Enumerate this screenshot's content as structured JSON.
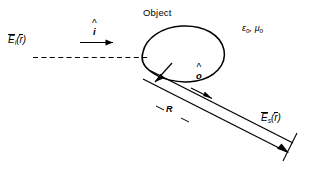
{
  "figure": {
    "background_color": "#ffffff",
    "ink_color": "#000000",
    "width": 314,
    "height": 180
  },
  "labels": {
    "object": "Object",
    "incident_field_symbol": "E",
    "incident_field_subscript": "i",
    "incident_field_argument_open": "(",
    "incident_field_argument_symbol": "r",
    "incident_field_argument_close": ")",
    "scattered_field_symbol": "E",
    "scattered_field_subscript": "s",
    "scattered_field_argument_open": "(",
    "scattered_field_argument_symbol": "r",
    "scattered_field_argument_close": ")",
    "incident_direction": "i",
    "observation_direction": "o",
    "distance": "R",
    "permittivity_symbol": "ε",
    "permittivity_subscript": "o",
    "medium_separator": ",",
    "permeability_symbol": "μ",
    "permeability_subscript": "o"
  },
  "geometry": {
    "incident_axis": "dashed horizontal line entering object from left",
    "incident_arrow": "solid horizontal arrow pointing right",
    "object_outline": "closed teardrop blob",
    "scatter_rays": "pair of parallel solid lines to lower right",
    "range_tick": "perpendicular end cap at far end of range",
    "source_point_arrow": "short arrow into object interior"
  }
}
